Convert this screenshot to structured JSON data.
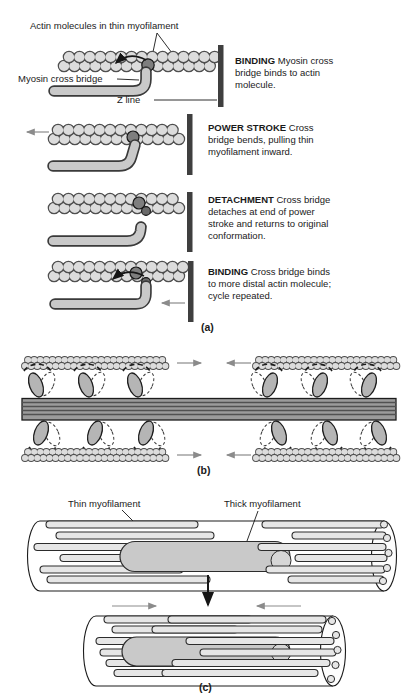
{
  "figure": {
    "panel_a": {
      "actin_label": "Actin molecules in thin myofilament",
      "myosin_label": "Myosin cross bridge",
      "z_line_label": "Z line",
      "steps": [
        {
          "keyword": "BINDING",
          "lines": [
            "Myosin cross",
            "bridge binds to actin",
            "molecule."
          ]
        },
        {
          "keyword": "POWER STROKE",
          "lines": [
            "Cross",
            "bridge bends, pulling thin",
            "myofilament inward."
          ]
        },
        {
          "keyword": "DETACHMENT",
          "lines": [
            "Cross bridge",
            "detaches at end of power",
            "stroke and returns to original",
            "conformation."
          ]
        },
        {
          "keyword": "BINDING",
          "lines": [
            "Cross bridge binds",
            "to more distal actin molecule;",
            "cycle repeated."
          ]
        }
      ],
      "caption": "(a)"
    },
    "panel_b": {
      "caption": "(b)"
    },
    "panel_c": {
      "thin_label": "Thin myofilament",
      "thick_label": "Thick myofilament",
      "caption": "(c)"
    },
    "colors": {
      "bead_fill": "#dcdcdc",
      "bead_outline": "#4f4f4f",
      "binding_bead": "#7e7e7e",
      "myosin_fill": "#c9c9c9",
      "outline": "#1c1c1c",
      "z_line": "#3f3f3f",
      "thick_filament": "#9b9b9b",
      "myosin_head": "#b5b5b5",
      "tube_fill": "#e6e6e6",
      "rod_fill": "#c9c9c9",
      "arrow_gray": "#8b8b8b",
      "text": "#1a1a1a"
    }
  }
}
